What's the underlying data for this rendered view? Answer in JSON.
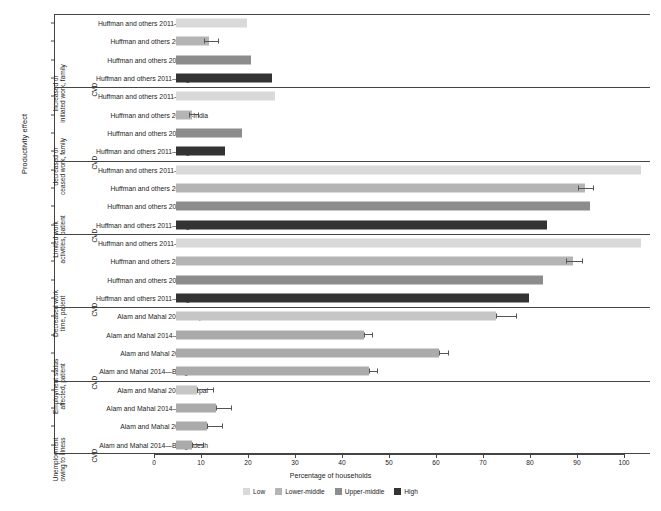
{
  "axis_title_y": "Productivity effect",
  "axis_title_x": "Percentage of households",
  "legend": {
    "items": [
      {
        "label": "Low",
        "color": "#d9d9d9"
      },
      {
        "label": "Lower-middle",
        "color": "#b4b4b4"
      },
      {
        "label": "Upper-middle",
        "color": "#8c8c8c"
      },
      {
        "label": "High",
        "color": "#333333"
      }
    ]
  },
  "chart_data": {
    "type": "bar",
    "orientation": "horizontal",
    "title": "",
    "xlabel": "Percentage of households",
    "ylabel": "Productivity effect",
    "xlim": [
      0,
      100
    ],
    "xticks": [
      0,
      10,
      20,
      30,
      40,
      50,
      60,
      70,
      80,
      90,
      100
    ],
    "grid": false,
    "legend_position": "bottom",
    "series_legend": [
      "Low",
      "Lower-middle",
      "Upper-middle",
      "High"
    ],
    "groups": [
      {
        "category": "Increased or\ninitiated work, family",
        "disease": "CVD",
        "rows": [
          {
            "label": "Huffman and others 2011—Tanzania",
            "value": 15.0,
            "group": "Low",
            "color": "#d9d9d9",
            "err_low": null,
            "err_high": null
          },
          {
            "label": "Huffman and others 2011—India",
            "value": 7.0,
            "group": "Lower-middle",
            "color": "#b4b4b4",
            "err_low": 6.0,
            "err_high": 9.2
          },
          {
            "label": "Huffman and others 2011—China",
            "value": 16.0,
            "group": "Upper-middle",
            "color": "#8c8c8c",
            "err_low": null,
            "err_high": null
          },
          {
            "label": "Huffman and others 2011—Argentina",
            "value": 20.5,
            "group": "High",
            "color": "#333333",
            "err_low": null,
            "err_high": null
          }
        ]
      },
      {
        "category": "decreased or\nceased work, family",
        "disease": "CVD",
        "rows": [
          {
            "label": "Huffman and others 2011—Tanzania",
            "value": 21.0,
            "group": "Low",
            "color": "#d9d9d9",
            "err_low": null,
            "err_high": null
          },
          {
            "label": "Huffman and others 2011—India",
            "value": 3.5,
            "group": "Lower-middle",
            "color": "#b4b4b4",
            "err_low": 2.8,
            "err_high": 5.0
          },
          {
            "label": "Huffman and others 2011—China",
            "value": 14.0,
            "group": "Upper-middle",
            "color": "#8c8c8c",
            "err_low": null,
            "err_high": null
          },
          {
            "label": "Huffman and others 2011—Argentina",
            "value": 10.5,
            "group": "High",
            "color": "#333333",
            "err_low": null,
            "err_high": null
          }
        ]
      },
      {
        "category": "Limited work\nactivities, patient",
        "disease": "CVD",
        "rows": [
          {
            "label": "Huffman and others 2011—Tanzania",
            "value": 99.0,
            "group": "Low",
            "color": "#d9d9d9",
            "err_low": null,
            "err_high": null
          },
          {
            "label": "Huffman and others 2011—India",
            "value": 87.0,
            "group": "Lower-middle",
            "color": "#b4b4b4",
            "err_low": 85.5,
            "err_high": 89.0
          },
          {
            "label": "Huffman and others 2011—China",
            "value": 88.0,
            "group": "Upper-middle",
            "color": "#8c8c8c",
            "err_low": null,
            "err_high": null
          },
          {
            "label": "Huffman and others 2011—Argentina",
            "value": 79.0,
            "group": "High",
            "color": "#333333",
            "err_low": null,
            "err_high": null
          }
        ]
      },
      {
        "category": "Decreased work\ntime, patient",
        "disease": "CVD",
        "rows": [
          {
            "label": "Huffman and others 2011—Tanzania",
            "value": 99.0,
            "group": "Low",
            "color": "#d9d9d9",
            "err_low": null,
            "err_high": null
          },
          {
            "label": "Huffman and others 2011—India",
            "value": 84.5,
            "group": "Lower-middle",
            "color": "#b4b4b4",
            "err_low": 83.0,
            "err_high": 86.5
          },
          {
            "label": "Huffman and others 2011—China",
            "value": 78.0,
            "group": "Upper-middle",
            "color": "#8c8c8c",
            "err_low": null,
            "err_high": null
          },
          {
            "label": "Huffman and others 2011—Argentina",
            "value": 75.0,
            "group": "High",
            "color": "#333333",
            "err_low": null,
            "err_high": null
          }
        ]
      },
      {
        "category": "Employment status\naffected, patient",
        "disease": "CVD",
        "rows": [
          {
            "label": "Alam and Mahal 2014—Nepal",
            "value": 68.0,
            "group": "Low",
            "color": "#c6c6c6",
            "err_low": 68.0,
            "err_high": 72.5
          },
          {
            "label": "Alam and Mahal 2014—Sri Lanka",
            "value": 40.0,
            "group": "Low",
            "color": "#ababab",
            "err_low": 40.0,
            "err_high": 42.0
          },
          {
            "label": "Alam and Mahal 2014—India",
            "value": 56.0,
            "group": "Low",
            "color": "#ababab",
            "err_low": 56.0,
            "err_high": 58.0
          },
          {
            "label": "Alam and Mahal 2014—Bangladesh",
            "value": 41.0,
            "group": "Low",
            "color": "#ababab",
            "err_low": 41.0,
            "err_high": 43.0
          }
        ]
      },
      {
        "category": "Unemployment\nowing to illness",
        "disease": "CVD",
        "rows": [
          {
            "label": "Alam and Mahal 2014—Nepal",
            "value": 4.5,
            "group": "Low",
            "color": "#c6c6c6",
            "err_low": 4.5,
            "err_high": 8.0
          },
          {
            "label": "Alam and Mahal 2014—Sri Lanka",
            "value": 8.5,
            "group": "Low",
            "color": "#ababab",
            "err_low": 8.5,
            "err_high": 12.0
          },
          {
            "label": "Alam and Mahal 2014—India",
            "value": 6.5,
            "group": "Low",
            "color": "#ababab",
            "err_low": 6.5,
            "err_high": 10.0
          },
          {
            "label": "Alam and Mahal 2014—Bangladesh",
            "value": 3.5,
            "group": "Low",
            "color": "#ababab",
            "err_low": 3.5,
            "err_high": 6.0
          }
        ]
      }
    ]
  }
}
